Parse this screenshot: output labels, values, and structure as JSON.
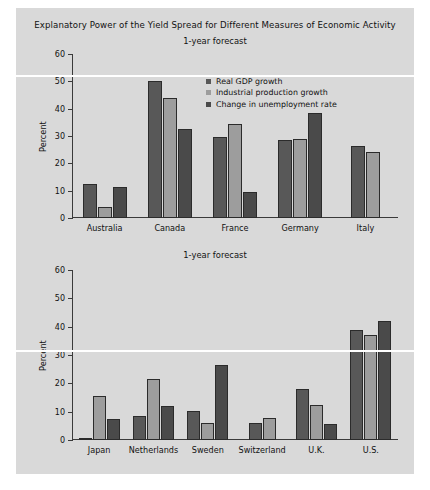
{
  "figure": {
    "title": "Explanatory Power of the Yield Spread for Different Measures of Economic Activity",
    "background_color": "#d9d9d9",
    "page_background_color": "#ffffff"
  },
  "legend": {
    "position": "top-center-right",
    "entries": [
      {
        "label": "Real GDP growth",
        "color": "#585858"
      },
      {
        "label": "Industrial production growth",
        "color": "#9d9d9d"
      },
      {
        "label": "Change in unemployment rate",
        "color": "#4a4a4a"
      }
    ]
  },
  "panels": [
    {
      "name": "top-panel",
      "subtitle": "1-year forecast",
      "ylabel": "Percent",
      "yticks": [
        "60",
        "50",
        "40",
        "30",
        "20",
        "10",
        "0"
      ],
      "categories": [
        "Australia",
        "Canada",
        "France",
        "Germany",
        "Italy"
      ]
    },
    {
      "name": "bottom-panel",
      "subtitle": "1-year forecast",
      "ylabel": "Percent",
      "yticks": [
        "60",
        "50",
        "40",
        "30",
        "20",
        "10",
        "0"
      ],
      "categories": [
        "Japan",
        "Netherlands",
        "Sweden",
        "Switzerland",
        "U.K.",
        "U.S."
      ]
    }
  ],
  "chart_data": [
    {
      "type": "bar",
      "title": "Explanatory Power of the Yield Spread for Different Measures of Economic Activity",
      "subtitle": "1-year forecast",
      "xlabel": "",
      "ylabel": "Percent",
      "ylim": [
        0,
        60
      ],
      "ytick_step": 10,
      "grid": false,
      "legend_position": "upper center",
      "categories": [
        "Australia",
        "Canada",
        "France",
        "Germany",
        "Italy"
      ],
      "series": [
        {
          "name": "Real GDP growth",
          "color": "#585858",
          "values": [
            12.5,
            50.0,
            29.5,
            28.5,
            26.5
          ]
        },
        {
          "name": "Industrial production growth",
          "color": "#9d9d9d",
          "values": [
            4.0,
            44.0,
            34.5,
            29.0,
            24.0
          ]
        },
        {
          "name": "Change in unemployment rate",
          "color": "#4a4a4a",
          "values": [
            11.5,
            32.5,
            9.5,
            38.5,
            null
          ]
        }
      ]
    },
    {
      "type": "bar",
      "title": "",
      "subtitle": "1-year forecast",
      "xlabel": "",
      "ylabel": "Percent",
      "ylim": [
        0,
        60
      ],
      "ytick_step": 10,
      "grid": false,
      "legend_position": "none",
      "categories": [
        "Japan",
        "Netherlands",
        "Sweden",
        "Switzerland",
        "U.K.",
        "U.S."
      ],
      "series": [
        {
          "name": "Real GDP growth",
          "color": "#585858",
          "values": [
            0.7,
            8.5,
            10.2,
            6.0,
            18.0,
            39.0
          ]
        },
        {
          "name": "Industrial production growth",
          "color": "#9d9d9d",
          "values": [
            15.5,
            21.5,
            6.0,
            7.8,
            12.5,
            37.0
          ]
        },
        {
          "name": "Change in unemployment rate",
          "color": "#4a4a4a",
          "values": [
            7.3,
            12.0,
            26.5,
            null,
            5.5,
            42.0
          ]
        }
      ]
    }
  ]
}
